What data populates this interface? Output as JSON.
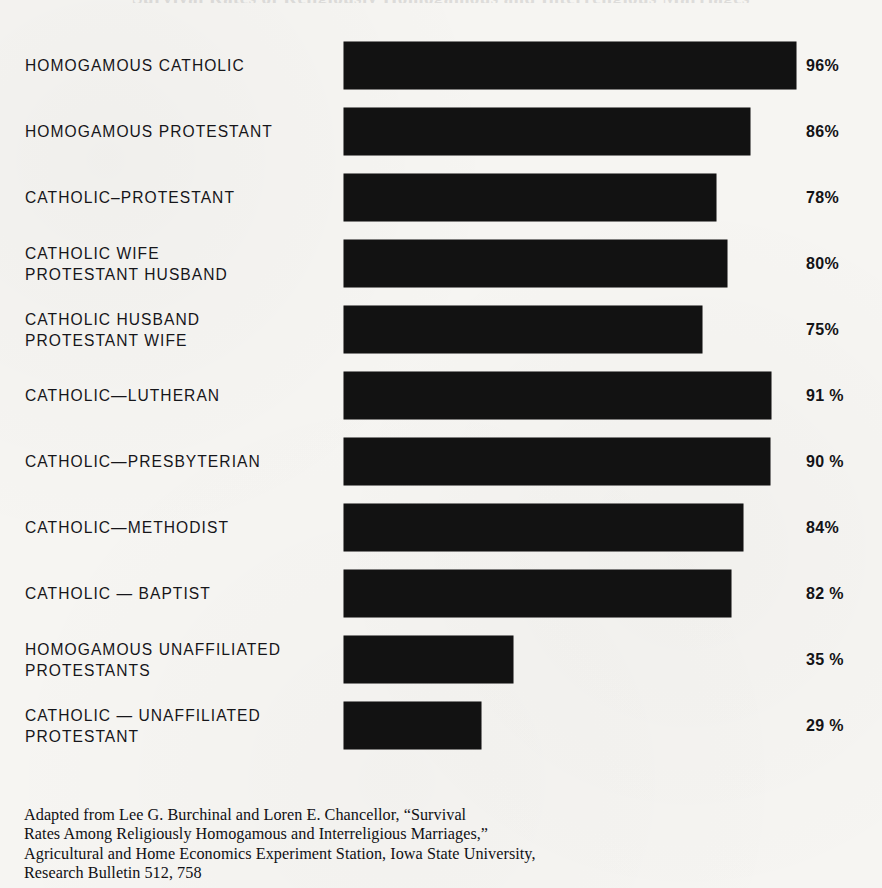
{
  "page": {
    "background_color": "#f6f5f2",
    "bar_color": "#121212",
    "text_color": "#16161a",
    "title_remnant": "Survival Rates of Religiously Homogamous and Interreligious Marriages"
  },
  "chart_data": {
    "type": "bar",
    "orientation": "horizontal",
    "title": "",
    "xlabel": "",
    "ylabel": "",
    "xlim": [
      0,
      100
    ],
    "grid": false,
    "legend": null,
    "value_suffix": "%",
    "categories": [
      "HOMOGAMOUS CATHOLIC",
      "HOMOGAMOUS PROTESTANT",
      "CATHOLIC-PROTESTANT",
      "CATHOLIC WIFE PROTESTANT HUSBAND",
      "CATHOLIC HUSBAND PROTESTANT WIFE",
      "CATHOLIC-LUTHERAN",
      "CATHOLIC-PRESBYTERIAN",
      "CATHOLIC-METHODIST",
      "CATHOLIC-BAPTIST",
      "HOMOGAMOUS UNAFFILIATED PROTESTANTS",
      "CATHOLIC-UNAFFILIATED PROTESTANT"
    ],
    "values": [
      96,
      86,
      78,
      80,
      75,
      91,
      90,
      84,
      82,
      35,
      29
    ]
  },
  "rows": [
    {
      "label_line1": "HOMOGAMOUS CATHOLIC",
      "label_line2": "",
      "value": 96,
      "value_label": "96%",
      "bar_width_px": 452
    },
    {
      "label_line1": "HOMOGAMOUS PROTESTANT",
      "label_line2": "",
      "value": 86,
      "value_label": "86%",
      "bar_width_px": 406
    },
    {
      "label_line1": "CATHOLIC–PROTESTANT",
      "label_line2": "",
      "value": 78,
      "value_label": "78%",
      "bar_width_px": 372
    },
    {
      "label_line1": "CATHOLIC WIFE",
      "label_line2": "PROTESTANT HUSBAND",
      "value": 80,
      "value_label": "80%",
      "bar_width_px": 383
    },
    {
      "label_line1": "CATHOLIC HUSBAND",
      "label_line2": "PROTESTANT WIFE",
      "value": 75,
      "value_label": "75%",
      "bar_width_px": 358
    },
    {
      "label_line1": "CATHOLIC—LUTHERAN",
      "label_line2": "",
      "value": 91,
      "value_label": "91 %",
      "bar_width_px": 427
    },
    {
      "label_line1": "CATHOLIC—PRESBYTERIAN",
      "label_line2": "",
      "value": 90,
      "value_label": "90 %",
      "bar_width_px": 426
    },
    {
      "label_line1": "CATHOLIC—METHODIST",
      "label_line2": "",
      "value": 84,
      "value_label": "84%",
      "bar_width_px": 399
    },
    {
      "label_line1": "CATHOLIC — BAPTIST",
      "label_line2": "",
      "value": 82,
      "value_label": "82 %",
      "bar_width_px": 387
    },
    {
      "label_line1": "HOMOGAMOUS UNAFFILIATED",
      "label_line2": "PROTESTANTS",
      "value": 35,
      "value_label": "35 %",
      "bar_width_px": 169
    },
    {
      "label_line1": "CATHOLIC — UNAFFILIATED",
      "label_line2": "PROTESTANT",
      "value": 29,
      "value_label": "29 %",
      "bar_width_px": 137
    }
  ],
  "source": {
    "line1": "Adapted from Lee G. Burchinal and Loren E. Chancellor, “Survival",
    "line2": "Rates Among Religiously Homogamous and Interreligious Marriages,”",
    "line3": "Agricultural and Home Economics Experiment Station, Iowa State University,",
    "line4": "Research Bulletin 512, 758"
  }
}
